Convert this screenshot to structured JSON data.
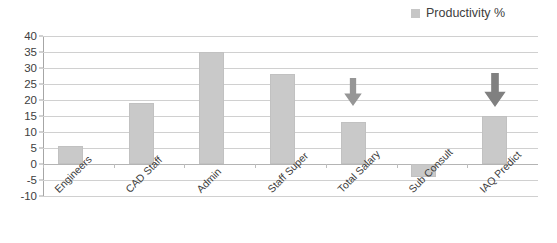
{
  "legend": {
    "entries": [
      {
        "label": "Productivity %",
        "color": "#c6c6c6"
      }
    ]
  },
  "chart_data": {
    "type": "bar",
    "title": "",
    "xlabel": "",
    "ylabel": "",
    "ylim": [
      -10,
      40
    ],
    "ytick_step": 5,
    "grid": true,
    "legend_position": "top-right",
    "categories": [
      "Engineers",
      "CAD Staff",
      "Admin",
      "Staff Super",
      "Total Salary",
      "Sub Consult",
      "IAQ Predict"
    ],
    "yticks": [
      "40",
      "35",
      "30",
      "25",
      "20",
      "15",
      "10",
      "5",
      "0",
      "-5",
      "-10"
    ],
    "series": [
      {
        "name": "Productivity %",
        "color": "#c9c9c9",
        "values": [
          5.5,
          19,
          35,
          28,
          13,
          -4,
          15
        ]
      }
    ],
    "annotations": [
      {
        "type": "down-arrow",
        "category": "Total Salary",
        "color": "#969696",
        "size": "small"
      },
      {
        "type": "down-arrow",
        "category": "IAQ Predict",
        "color": "#808080",
        "size": "large"
      }
    ]
  }
}
